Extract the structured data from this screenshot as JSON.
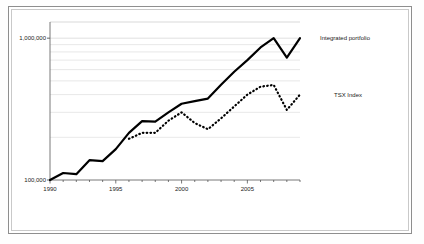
{
  "chart_data": {
    "type": "line",
    "title": "",
    "subtitle": "",
    "xlabel": "",
    "ylabel": "",
    "yscale": "log",
    "ylim": [
      100000,
      1300000
    ],
    "xlim": [
      1990,
      2009
    ],
    "grid": true,
    "grid_axis": "y",
    "legend_position": "right-inline",
    "y_tick_labels": [
      "1,000,000",
      "100,000"
    ],
    "y_tick_values": [
      1000000,
      100000
    ],
    "x_tick_labels": [
      "1990",
      "1995",
      "2000",
      "2005"
    ],
    "x_tick_values": [
      1990,
      1995,
      2000,
      2005
    ],
    "x": [
      1990,
      1991,
      1992,
      1993,
      1994,
      1995,
      1996,
      1997,
      1998,
      1999,
      2000,
      2001,
      2002,
      2003,
      2004,
      2005,
      2006,
      2007,
      2008,
      2009
    ],
    "series": [
      {
        "name": "Integrated portfolio",
        "style": "solid",
        "color": "#000000",
        "values": [
          100000,
          112000,
          110000,
          138000,
          136000,
          165000,
          215000,
          260000,
          258000,
          300000,
          345000,
          360000,
          375000,
          470000,
          580000,
          700000,
          860000,
          1000000,
          730000,
          1000000
        ]
      },
      {
        "name": "TSX Index",
        "style": "dotted",
        "color": "#000000",
        "values": [
          null,
          null,
          null,
          null,
          null,
          null,
          195000,
          215000,
          215000,
          262000,
          300000,
          252000,
          228000,
          272000,
          330000,
          400000,
          455000,
          468000,
          312000,
          400000
        ]
      }
    ],
    "annotations": [
      {
        "text": "Integrated portfolio",
        "x": 2009,
        "y": 1000000
      },
      {
        "text": "TSX Index",
        "x": 2009,
        "y": 400000
      }
    ]
  },
  "figure": {
    "background_color": "#ffffff",
    "frame_color": "#8e8e8e",
    "inner_frame_color": "#c9c9c9",
    "gridline_color": "#d8d8d8",
    "axis_color": "#555555"
  }
}
